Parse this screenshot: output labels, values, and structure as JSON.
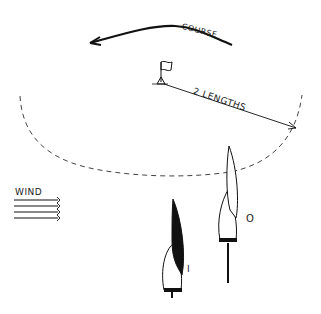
{
  "diagram": {
    "labels": {
      "course": "COURSE",
      "distance": "2 LENGTHS",
      "wind": "WIND",
      "boat_inside": "I",
      "boat_outside": "O"
    },
    "colors": {
      "ink": "#111111",
      "background": "#ffffff"
    },
    "elements": [
      "course-arrow",
      "mark-flag",
      "two-lengths-zone-circle",
      "two-lengths-dimension-line",
      "wind-indicator",
      "boat-inside",
      "boat-outside"
    ]
  }
}
